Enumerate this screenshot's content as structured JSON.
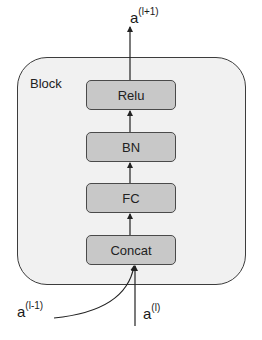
{
  "diagram": {
    "container": {
      "label": "Block",
      "fill": "#f1f1f1",
      "stroke": "#3c3c3c"
    },
    "layers": [
      {
        "id": "relu",
        "label": "Relu",
        "top": 80
      },
      {
        "id": "bn",
        "label": "BN",
        "top": 132
      },
      {
        "id": "fc",
        "label": "FC",
        "top": 183
      },
      {
        "id": "concat",
        "label": "Concat",
        "top": 235
      }
    ],
    "layer_style": {
      "fill": "#c8c8c8",
      "stroke": "#4a4a4a"
    },
    "inputs": [
      {
        "id": "prev-prev",
        "base": "a",
        "superscript": "(l-1)"
      },
      {
        "id": "prev",
        "base": "a",
        "superscript": "(l)"
      }
    ],
    "output": {
      "base": "a",
      "superscript": "(l+1)"
    },
    "flow": [
      "Concat",
      "FC",
      "BN",
      "Relu"
    ]
  }
}
